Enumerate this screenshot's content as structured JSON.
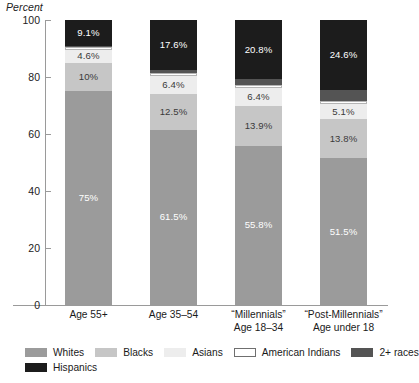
{
  "chart_data": {
    "type": "bar",
    "subtype": "stacked-bar-100",
    "title": "",
    "xlabel": "",
    "ylabel": "Percent",
    "ylim": [
      0,
      100
    ],
    "yticks": [
      0,
      20,
      40,
      60,
      80,
      100
    ],
    "ytick_labels": [
      "0",
      "20",
      "40",
      "60",
      "80",
      "100"
    ],
    "grid": false,
    "legend_position": "bottom",
    "categories": [
      "Age 55+",
      "Age 35–54",
      "“Millennials” Age 18–34",
      "“Post-Millennials” Age under 18"
    ],
    "category_lines": [
      [
        "Age 55+"
      ],
      [
        "Age 35–54"
      ],
      [
        "“Millennials”",
        "Age 18–34"
      ],
      [
        "“Post-Millennials”",
        "Age under 18"
      ]
    ],
    "series": [
      {
        "name": "Whites",
        "color": "#9b9b9b",
        "values": [
          75.0,
          61.5,
          55.8,
          51.5
        ],
        "labels": [
          "75%",
          "61.5%",
          "55.8%",
          "51.5%"
        ],
        "label_colors": [
          "#ffffff",
          "#ffffff",
          "#ffffff",
          "#ffffff"
        ]
      },
      {
        "name": "Blacks",
        "color": "#c6c6c6",
        "values": [
          10.0,
          12.5,
          13.9,
          13.8
        ],
        "labels": [
          "10%",
          "12.5%",
          "13.9%",
          "13.8%"
        ],
        "label_colors": [
          "#3a3a3a",
          "#3a3a3a",
          "#3a3a3a",
          "#3a3a3a"
        ]
      },
      {
        "name": "Asians",
        "color": "#ededed",
        "values": [
          4.6,
          6.4,
          6.4,
          5.1
        ],
        "labels": [
          "4.6%",
          "6.4%",
          "6.4%",
          "5.1%"
        ],
        "label_colors": [
          "#3a3a3a",
          "#3a3a3a",
          "#3a3a3a",
          "#3a3a3a"
        ]
      },
      {
        "name": "American Indians",
        "color": "#ffffff",
        "values": [
          0.8,
          0.9,
          1.0,
          1.1
        ],
        "labels": [
          "",
          "",
          "",
          ""
        ],
        "label_colors": [
          "#3a3a3a",
          "#3a3a3a",
          "#3a3a3a",
          "#3a3a3a"
        ]
      },
      {
        "name": "2+ races",
        "color": "#545454",
        "values": [
          0.5,
          1.1,
          2.1,
          3.9
        ],
        "labels": [
          "",
          "",
          "",
          ""
        ],
        "label_colors": [
          "#ffffff",
          "#ffffff",
          "#ffffff",
          "#ffffff"
        ]
      },
      {
        "name": "Hispanics",
        "color": "#1c1c1c",
        "values": [
          9.1,
          17.6,
          20.8,
          24.6
        ],
        "labels": [
          "9.1%",
          "17.6%",
          "20.8%",
          "24.6%"
        ],
        "label_colors": [
          "#ffffff",
          "#ffffff",
          "#ffffff",
          "#ffffff"
        ]
      }
    ],
    "legend_entries": [
      {
        "label": "Whites",
        "color": "#9b9b9b",
        "bordered": false
      },
      {
        "label": "Blacks",
        "color": "#c6c6c6",
        "bordered": false
      },
      {
        "label": "Asians",
        "color": "#ededed",
        "bordered": false
      },
      {
        "label": "American Indians",
        "color": "#ffffff",
        "bordered": true
      },
      {
        "label": "2+ races",
        "color": "#545454",
        "bordered": false
      },
      {
        "label": "Hispanics",
        "color": "#1c1c1c",
        "bordered": false
      }
    ]
  },
  "axis": {
    "y_title": "Percent"
  }
}
